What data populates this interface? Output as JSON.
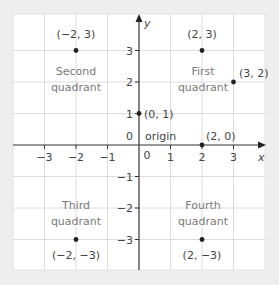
{
  "colors": {
    "background": "#eeeeee",
    "panel": "#ffffff",
    "grid": "#dcdcdc",
    "axis": "#333333",
    "text": "#444444",
    "quadrant_text": "#7a7a7a",
    "point": "#222222"
  },
  "axes": {
    "x_label": "x",
    "y_label": "y",
    "x_ticks": [
      "−3",
      "−2",
      "−1",
      "0",
      "1",
      "2",
      "3"
    ],
    "y_ticks": [
      "3",
      "2",
      "1",
      "0",
      "−1",
      "−2",
      "−3"
    ],
    "xlim": [
      -4,
      4
    ],
    "ylim": [
      -4,
      4
    ]
  },
  "quadrants": {
    "first": [
      "First",
      "quadrant"
    ],
    "second": [
      "Second",
      "quadrant"
    ],
    "third": [
      "Third",
      "quadrant"
    ],
    "fourth": [
      "Fourth",
      "quadrant"
    ]
  },
  "origin_label": "origin",
  "points": [
    {
      "label": "(−2, 3)",
      "x": -2,
      "y": 3
    },
    {
      "label": "(2, 3)",
      "x": 2,
      "y": 3
    },
    {
      "label": "(3, 2)",
      "x": 3,
      "y": 2
    },
    {
      "label": "(0, 1)",
      "x": 0,
      "y": 1
    },
    {
      "label": "(2, 0)",
      "x": 2,
      "y": 0
    },
    {
      "label": "(−2, −3)",
      "x": -2,
      "y": -3
    },
    {
      "label": "(2, −3)",
      "x": 2,
      "y": -3
    }
  ]
}
